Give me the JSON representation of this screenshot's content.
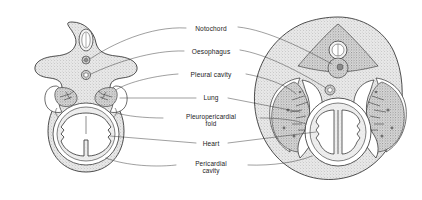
{
  "figure": {
    "background_color": "#ffffff",
    "ink_color": "#2f2f2f",
    "text_color": "#1a1a1a",
    "tissue_fill": "stipple-grey"
  },
  "labels": [
    {
      "id": "notochord",
      "text": "Notochord",
      "lines": [
        "Notochord"
      ],
      "x": 211,
      "y": 29
    },
    {
      "id": "oesophagus",
      "text": "Oesophagus",
      "lines": [
        "Oesophagus"
      ],
      "x": 211,
      "y": 52
    },
    {
      "id": "pleural-cavity",
      "text": "Pleural cavity",
      "lines": [
        "Pleural cavity"
      ],
      "x": 211,
      "y": 75
    },
    {
      "id": "lung",
      "text": "Lung",
      "lines": [
        "Lung"
      ],
      "x": 211,
      "y": 98
    },
    {
      "id": "pleuropericardial-fold",
      "text": "Pleuropericardial fold",
      "lines": [
        "Pleuropericardial",
        "fold"
      ],
      "x": 211,
      "y": 119
    },
    {
      "id": "heart",
      "text": "Heart",
      "lines": [
        "Heart"
      ],
      "x": 211,
      "y": 144
    },
    {
      "id": "pericardial-cavity",
      "text": "Pericardial cavity",
      "lines": [
        "Pericardial",
        "cavity"
      ],
      "x": 211,
      "y": 166
    }
  ],
  "left_figure": {
    "id": "early-stage-section",
    "name": "Earlier stage transverse section",
    "structures": [
      "neural tube",
      "notochord",
      "oesophagus",
      "lung bud",
      "pleural cavity",
      "pleuropericardial fold",
      "heart",
      "pericardial cavity",
      "body wall"
    ]
  },
  "right_figure": {
    "id": "later-stage-section",
    "name": "Later stage transverse section",
    "structures": [
      "neural tube",
      "notochord",
      "oesophagus",
      "lung",
      "pleural cavity",
      "pleuropericardial fold",
      "heart",
      "pericardial cavity",
      "body wall"
    ]
  }
}
